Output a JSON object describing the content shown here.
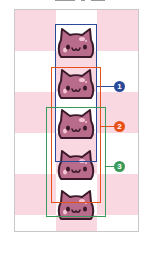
{
  "figure": {
    "grid": {
      "columns": 3,
      "rows": 6,
      "pattern": [
        "pink",
        "white",
        "pink",
        "white",
        "pink",
        "white",
        "pink",
        "white",
        "pink",
        "white",
        "pink",
        "white",
        "pink",
        "white",
        "pink",
        "white",
        "pink",
        "white"
      ],
      "colors": {
        "pink": "#f9d8e1",
        "white": "#ffffff",
        "border": "#c8c8c8"
      }
    },
    "sprites": [
      {
        "name": "cat-head-1",
        "top": 27
      },
      {
        "name": "cat-head-2",
        "top": 68
      },
      {
        "name": "cat-head-3",
        "top": 108
      },
      {
        "name": "cat-head-4",
        "top": 149
      },
      {
        "name": "cat-head-5",
        "top": 189
      }
    ],
    "sprite_colors": {
      "fill": "#b86b8a",
      "outline": "#3a1a2a",
      "highlight": "#f3c4d4",
      "cheek": "#e8a0b8"
    },
    "selections": [
      {
        "id": "1",
        "label": "1",
        "color": "#2a4a9a",
        "left": 55,
        "top": 24,
        "width": 42,
        "height": 138,
        "badge_top": 81
      },
      {
        "id": "2",
        "label": "2",
        "color": "#e8501a",
        "left": 51,
        "top": 67,
        "width": 50,
        "height": 136,
        "badge_top": 121
      },
      {
        "id": "3",
        "label": "3",
        "color": "#3a9a5a",
        "left": 46,
        "top": 107,
        "width": 60,
        "height": 110,
        "badge_top": 161
      }
    ]
  }
}
